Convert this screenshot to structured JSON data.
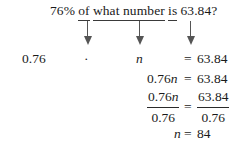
{
  "problem": {
    "question": {
      "percent": "76%",
      "of_word": "of",
      "unknown_phrase": "what number",
      "is_word": "is",
      "value": "63.84?"
    },
    "arrows": [
      {
        "name": "arrow-to-multiply",
        "x": 83,
        "y": 21
      },
      {
        "name": "arrow-to-variable",
        "x": 135,
        "y": 21
      },
      {
        "name": "arrow-to-equals",
        "x": 186,
        "y": 21
      }
    ],
    "translation_row": {
      "decimal": "0.76",
      "operator": "·",
      "variable": "n",
      "equals": "=",
      "result": "63.84"
    },
    "step_simplified": {
      "left": "0.76",
      "variable": "n",
      "equals": "=",
      "right": "63.84"
    },
    "step_divide": {
      "left_numerator": "0.76",
      "left_numerator_variable": "n",
      "left_denominator": "0.76",
      "equals": "=",
      "right_numerator": "63.84",
      "right_denominator": "0.76"
    },
    "solution": {
      "variable": "n",
      "equals": "=",
      "value": "84"
    }
  },
  "colors": {
    "background": "#ffffff",
    "text": "#1a1a1a",
    "arrow": "#555555",
    "rule": "#2a2a2a"
  }
}
